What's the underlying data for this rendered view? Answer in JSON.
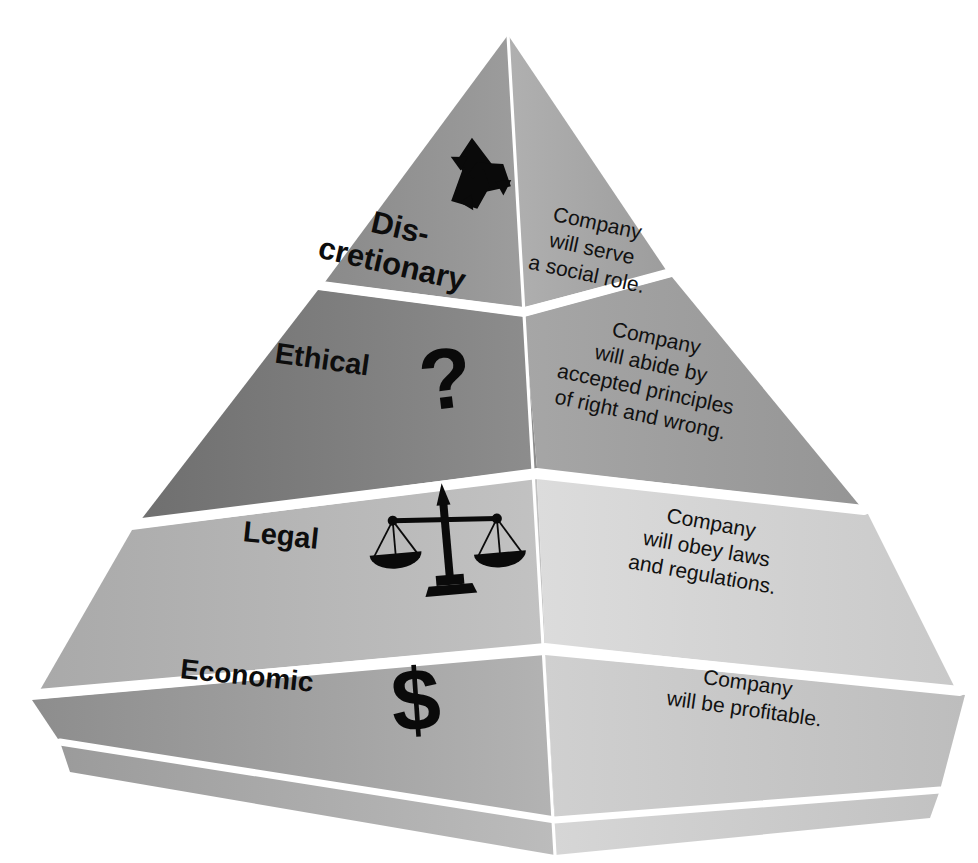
{
  "diagram": {
    "type": "pyramid",
    "orientation": "3d-left-right-faces",
    "tier_count": 4,
    "background_color": "#ffffff",
    "edge_highlight_color": "#ffffff",
    "ink_color": "#0d0d0d",
    "tiers": [
      {
        "index": 1,
        "position": "top",
        "label": "Dis-",
        "label_line2": "cretionary",
        "label_full": "Discretionary",
        "description_lines": [
          "Company",
          "will serve",
          "a social role."
        ],
        "description_full": "Company will serve a social role.",
        "icon": "recycling-symbol",
        "icon_glyph": "♻",
        "left_face_color": "#8f8f8f",
        "right_face_color": "#a8a8a8"
      },
      {
        "index": 2,
        "position": "upper-middle",
        "label": "Ethical",
        "label_line2": "",
        "label_full": "Ethical",
        "description_lines": [
          "Company",
          "will abide by",
          "accepted principles",
          "of right and wrong."
        ],
        "description_full": "Company will abide by accepted principles of right and wrong.",
        "icon": "question-mark",
        "icon_glyph": "?",
        "left_face_color": "#7d7d7d",
        "right_face_color": "#9e9e9e"
      },
      {
        "index": 3,
        "position": "lower-middle",
        "label": "Legal",
        "label_line2": "",
        "label_full": "Legal",
        "description_lines": [
          "Company",
          "will obey laws",
          "and regulations."
        ],
        "description_full": "Company will obey laws and regulations.",
        "icon": "scales-of-justice",
        "icon_glyph": "⚖",
        "left_face_color": "#b4b4b4",
        "right_face_color": "#d2d2d2"
      },
      {
        "index": 4,
        "position": "base",
        "label": "Economic",
        "label_line2": "",
        "label_full": "Economic",
        "description_lines": [
          "Company",
          "will be profitable."
        ],
        "description_full": "Company will be profitable.",
        "icon": "dollar-sign",
        "icon_glyph": "$",
        "left_face_color": "#9a9a9a",
        "right_face_color": "#c6c6c6"
      }
    ]
  }
}
